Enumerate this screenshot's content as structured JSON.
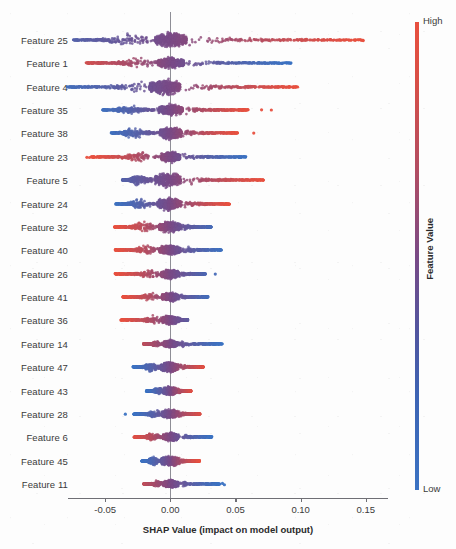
{
  "chart_data": {
    "type": "scatter",
    "plot_kind": "shap-beeswarm-summary",
    "title": "",
    "xlabel": "SHAP Value (impact on model output)",
    "ylabel": "",
    "xlim": [
      -0.0785,
      0.167
    ],
    "xticks": [
      -0.05,
      0.0,
      0.05,
      0.1,
      0.15
    ],
    "xticklabels": [
      "-0.05",
      "0.00",
      "0.05",
      "0.10",
      "0.15"
    ],
    "grid": false,
    "zero_reference_line": 0.0,
    "colorbar": {
      "title": "Feature Value",
      "high_label": "High",
      "low_label": "Low",
      "high_color": "#e8503f",
      "mid_color": "#7a4a86",
      "low_color": "#3b73c3",
      "position": "right"
    },
    "categories": [
      "Feature 25",
      "Feature 1",
      "Feature 4",
      "Feature 35",
      "Feature 38",
      "Feature 23",
      "Feature 5",
      "Feature 24",
      "Feature 32",
      "Feature 40",
      "Feature 26",
      "Feature 41",
      "Feature 36",
      "Feature 14",
      "Feature 47",
      "Feature 43",
      "Feature 28",
      "Feature 6",
      "Feature 45",
      "Feature 11"
    ],
    "series": [
      {
        "name": "Feature 25",
        "orientation": "low-left-high-right",
        "x_min": -0.0745,
        "x_max": 0.148,
        "dense_core": [
          -0.0115,
          0.0125
        ],
        "bulge_negative": -0.033,
        "bulge_positive": 0.0095,
        "max_density_width": 9.0,
        "outliers": [
          0.148
        ]
      },
      {
        "name": "Feature 1",
        "orientation": "high-left-low-right",
        "x_min": -0.065,
        "x_max": 0.093,
        "dense_core": [
          -0.0095,
          0.0105
        ],
        "bulge_negative": -0.025,
        "bulge_positive": 0.008,
        "max_density_width": 7.0,
        "outliers": []
      },
      {
        "name": "Feature 4",
        "orientation": "low-left-high-right",
        "x_min": -0.0795,
        "x_max": 0.0985,
        "dense_core": [
          -0.016,
          0.0075
        ],
        "bulge_negative": -0.0205,
        "bulge_positive": 0.0045,
        "max_density_width": 9.5,
        "outliers": []
      },
      {
        "name": "Feature 35",
        "orientation": "low-left-high-right",
        "x_min": -0.052,
        "x_max": 0.06,
        "dense_core": [
          -0.009,
          0.0095
        ],
        "bulge_negative": -0.031,
        "bulge_positive": 0.006,
        "max_density_width": 7.0,
        "outliers": [
          0.07,
          0.0775
        ]
      },
      {
        "name": "Feature 38",
        "orientation": "low-left-high-right",
        "x_min": -0.0455,
        "x_max": 0.052,
        "dense_core": [
          -0.008,
          0.0085
        ],
        "bulge_negative": -0.0285,
        "bulge_positive": 0.004,
        "max_density_width": 7.5,
        "outliers": [
          0.064
        ]
      },
      {
        "name": "Feature 23",
        "orientation": "high-left-low-right",
        "x_min": -0.0605,
        "x_max": 0.058,
        "dense_core": [
          -0.007,
          0.0075
        ],
        "bulge_negative": -0.023,
        "bulge_positive": 0.0065,
        "max_density_width": 6.5,
        "outliers": [
          -0.064,
          -0.062
        ]
      },
      {
        "name": "Feature 5",
        "orientation": "low-left-high-right",
        "x_min": -0.037,
        "x_max": 0.0715,
        "dense_core": [
          -0.0115,
          0.008
        ],
        "bulge_negative": -0.025,
        "bulge_positive": 0.005,
        "max_density_width": 9.0,
        "outliers": []
      },
      {
        "name": "Feature 24",
        "orientation": "low-left-high-right",
        "x_min": -0.042,
        "x_max": 0.0455,
        "dense_core": [
          -0.01,
          0.008
        ],
        "bulge_negative": -0.0235,
        "bulge_positive": 0.0045,
        "max_density_width": 8.0,
        "outliers": []
      },
      {
        "name": "Feature 32",
        "orientation": "high-left-low-right",
        "x_min": -0.043,
        "x_max": 0.0315,
        "dense_core": [
          -0.009,
          0.008
        ],
        "bulge_negative": -0.0205,
        "bulge_positive": 0.0075,
        "max_density_width": 6.5,
        "outliers": []
      },
      {
        "name": "Feature 40",
        "orientation": "high-left-low-right",
        "x_min": -0.0425,
        "x_max": 0.0395,
        "dense_core": [
          -0.0085,
          0.0075
        ],
        "bulge_negative": -0.0185,
        "bulge_positive": 0.011,
        "max_density_width": 6.0,
        "outliers": []
      },
      {
        "name": "Feature 26",
        "orientation": "high-left-low-right",
        "x_min": -0.0425,
        "x_max": 0.027,
        "dense_core": [
          -0.007,
          0.0065
        ],
        "bulge_negative": -0.016,
        "bulge_positive": 0.0055,
        "max_density_width": 6.0,
        "outliers": [
          0.0345
        ]
      },
      {
        "name": "Feature 41",
        "orientation": "high-left-low-right",
        "x_min": -0.0365,
        "x_max": 0.029,
        "dense_core": [
          -0.0065,
          0.006
        ],
        "bulge_negative": -0.015,
        "bulge_positive": 0.005,
        "max_density_width": 5.5,
        "outliers": []
      },
      {
        "name": "Feature 36",
        "orientation": "high-left-low-right",
        "x_min": -0.038,
        "x_max": 0.0135,
        "dense_core": [
          -0.006,
          0.006
        ],
        "bulge_negative": -0.0125,
        "bulge_positive": 0.0055,
        "max_density_width": 6.0,
        "outliers": []
      },
      {
        "name": "Feature 14",
        "orientation": "high-left-low-right",
        "x_min": -0.0205,
        "x_max": 0.04,
        "dense_core": [
          -0.005,
          0.0055
        ],
        "bulge_negative": -0.0105,
        "bulge_positive": 0.006,
        "max_density_width": 4.5,
        "outliers": []
      },
      {
        "name": "Feature 47",
        "orientation": "low-left-high-right",
        "x_min": -0.029,
        "x_max": 0.0255,
        "dense_core": [
          -0.0075,
          0.006
        ],
        "bulge_negative": -0.015,
        "bulge_positive": 0.006,
        "max_density_width": 6.5,
        "outliers": []
      },
      {
        "name": "Feature 43",
        "orientation": "low-left-high-right",
        "x_min": -0.0185,
        "x_max": 0.016,
        "dense_core": [
          -0.0055,
          0.005
        ],
        "bulge_negative": -0.0095,
        "bulge_positive": 0.005,
        "max_density_width": 5.5,
        "outliers": []
      },
      {
        "name": "Feature 28",
        "orientation": "low-left-high-right",
        "x_min": -0.028,
        "x_max": 0.023,
        "dense_core": [
          -0.0065,
          0.006
        ],
        "bulge_negative": -0.012,
        "bulge_positive": 0.0055,
        "max_density_width": 5.5,
        "outliers": [
          -0.0345
        ]
      },
      {
        "name": "Feature 6",
        "orientation": "high-left-low-right",
        "x_min": -0.028,
        "x_max": 0.032,
        "dense_core": [
          -0.006,
          0.006
        ],
        "bulge_negative": -0.014,
        "bulge_positive": 0.0065,
        "max_density_width": 5.5,
        "outliers": []
      },
      {
        "name": "Feature 45",
        "orientation": "low-left-high-right",
        "x_min": -0.022,
        "x_max": 0.0225,
        "dense_core": [
          -0.007,
          0.006
        ],
        "bulge_negative": -0.0135,
        "bulge_positive": 0.0055,
        "max_density_width": 6.5,
        "outliers": []
      },
      {
        "name": "Feature 11",
        "orientation": "high-left-low-right",
        "x_min": -0.0205,
        "x_max": 0.038,
        "dense_core": [
          -0.0055,
          0.006
        ],
        "bulge_negative": -0.01,
        "bulge_positive": 0.007,
        "max_density_width": 5.0,
        "outliers": [
          0.04,
          0.0415
        ]
      }
    ]
  }
}
